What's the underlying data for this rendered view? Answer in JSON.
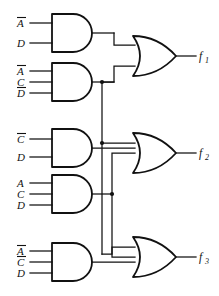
{
  "figure": {
    "type": "logic-circuit-diagram",
    "line_color": "#111111",
    "background_color": "#ffffff"
  },
  "and_gates": [
    {
      "id": "and1",
      "gate_type": "AND",
      "inputs": [
        {
          "name": "A",
          "complemented": true
        },
        {
          "name": "D",
          "complemented": false
        }
      ]
    },
    {
      "id": "and2",
      "gate_type": "AND",
      "inputs": [
        {
          "name": "A",
          "complemented": true
        },
        {
          "name": "C",
          "complemented": false
        },
        {
          "name": "D",
          "complemented": true
        }
      ]
    },
    {
      "id": "and3",
      "gate_type": "AND",
      "inputs": [
        {
          "name": "C",
          "complemented": true
        },
        {
          "name": "D",
          "complemented": false
        }
      ]
    },
    {
      "id": "and4",
      "gate_type": "AND",
      "inputs": [
        {
          "name": "A",
          "complemented": false
        },
        {
          "name": "C",
          "complemented": false
        },
        {
          "name": "D",
          "complemented": false
        }
      ]
    },
    {
      "id": "and5",
      "gate_type": "AND",
      "inputs": [
        {
          "name": "A",
          "complemented": true
        },
        {
          "name": "C",
          "complemented": true
        },
        {
          "name": "D",
          "complemented": false
        }
      ]
    }
  ],
  "or_gates": [
    {
      "id": "or1",
      "gate_type": "OR",
      "output_label": "f",
      "output_subscript": "1",
      "input_count": 2,
      "driven_by": [
        "and1",
        "and2"
      ]
    },
    {
      "id": "or2",
      "gate_type": "OR",
      "output_label": "f",
      "output_subscript": "2",
      "input_count": 3,
      "driven_by": [
        "and2",
        "and3",
        "and4"
      ]
    },
    {
      "id": "or3",
      "gate_type": "OR",
      "output_label": "f",
      "output_subscript": "3",
      "input_count": 3,
      "driven_by": [
        "and2",
        "and4",
        "and5"
      ]
    }
  ],
  "junctions": [
    {
      "id": "junction-and2",
      "source": "and2",
      "fanout": [
        "or1",
        "or2",
        "or3"
      ]
    },
    {
      "id": "junction-and4",
      "source": "and4",
      "fanout": [
        "or2",
        "or3"
      ]
    }
  ],
  "input_labels": {
    "and1": [
      "A",
      "D"
    ],
    "and2": [
      "A",
      "C",
      "D"
    ],
    "and3": [
      "C",
      "D"
    ],
    "and4": [
      "A",
      "C",
      "D"
    ],
    "and5": [
      "A",
      "C",
      "D"
    ]
  },
  "outputs": [
    {
      "label": "f",
      "subscript": "1"
    },
    {
      "label": "f",
      "subscript": "2"
    },
    {
      "label": "f",
      "subscript": "3"
    }
  ]
}
